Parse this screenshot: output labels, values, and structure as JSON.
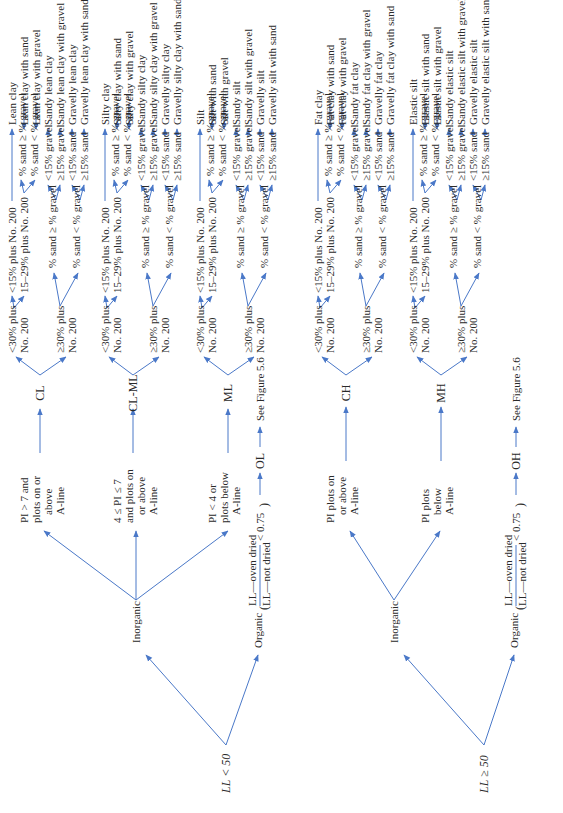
{
  "figure": {
    "accent_color": "#4a78c8",
    "root_low": "LL < 50",
    "root_high": "LL ≥ 50",
    "inorganic": "Inorganic",
    "organic": "Organic",
    "see_figure": "See Figure 5.6",
    "organic_ratio_num": "LL—oven dried",
    "organic_ratio_den": "LL—not dried",
    "organic_ratio_cond": "< 0.75",
    "low_conditions": [
      {
        "line1": "PI > 7 and",
        "line2": "plots on or",
        "line3": "above",
        "line4": "A-line",
        "symbol": "CL"
      },
      {
        "line1": "4 ≤ PI ≤ 7",
        "line2": "and plots on",
        "line3": "or above",
        "line4": "A-line",
        "symbol": "CL-ML"
      },
      {
        "line1": "PI < 4 or",
        "line2": "plots below",
        "line3": "A-line",
        "line4": "",
        "symbol": "ML"
      }
    ],
    "low_organic_symbol": "OL",
    "high_conditions": [
      {
        "line1": "PI plots on",
        "line2": "or above",
        "line3": "A-line",
        "symbol": "CH"
      },
      {
        "line1": "PI plots",
        "line2": "below",
        "line3": "A-line",
        "symbol": "MH"
      }
    ],
    "high_organic_symbol": "OH",
    "tier2": {
      "lt30_a": "<30% plus",
      "lt30_b": "No. 200",
      "ge30_a": "≥30% plus",
      "ge30_b": "No. 200"
    },
    "tier3": {
      "lt15": "<15% plus No. 200",
      "r15_29": "15–29% plus No. 200",
      "sand_ge": "% sand ≥ % gravel",
      "sand_lt": "% sand < % gravel"
    },
    "tier4": {
      "sand_ge": "% sand ≥ % gravel",
      "sand_lt": "% sand < % gravel",
      "lt15g": "<15% gravel",
      "ge15g": "≥15% gravel",
      "lt15s": "<15% sand",
      "ge15s": "≥15% sand"
    },
    "groups": [
      {
        "names": [
          "Lean clay",
          "Lean clay with sand",
          "Lean clay with gravel",
          "Sandy lean clay",
          "Sandy lean clay with gravel",
          "Gravelly lean clay",
          "Gravelly lean clay with sand"
        ]
      },
      {
        "names": [
          "Silty clay",
          "Silty clay with sand",
          "Silty clay with gravel",
          "Sandy silty clay",
          "Sandy silty clay with gravel",
          "Gravelly silty clay",
          "Gravelly silty clay  with sand"
        ]
      },
      {
        "names": [
          "Silt",
          "Silt with sand",
          "Silt with gravel",
          "Sandy silt",
          "Sandy silt with gravel",
          "Gravelly silt",
          "Gravelly silt with sand"
        ]
      },
      {
        "names": [
          "Fat clay",
          "Fat clay with sand",
          "Fat clay with gravel",
          "Sandy fat clay",
          "Sandy fat clay with gravel",
          "Gravelly fat clay",
          "Gravelly fat clay with sand"
        ]
      },
      {
        "names": [
          "Elastic silt",
          "Elastic silt with sand",
          "Elastic silt with gravel",
          "Sandy elastic silt",
          "Sandy elastic silt with gravel",
          "Gravelly elastic silt",
          "Gravelly elastic silt with sand"
        ]
      }
    ]
  }
}
